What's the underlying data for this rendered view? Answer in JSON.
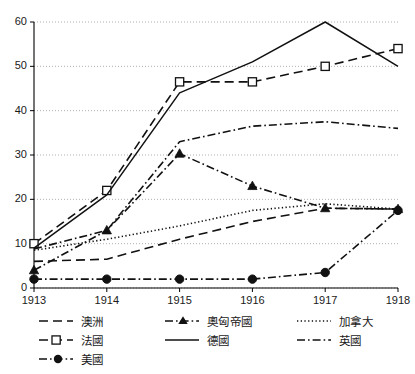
{
  "chart_data": {
    "type": "line",
    "title": "",
    "xlabel": "",
    "ylabel": "",
    "x": [
      1913,
      1914,
      1915,
      1916,
      1917,
      1918
    ],
    "xtick_labels": [
      "1913",
      "1914",
      "1915",
      "1916",
      "1917",
      "1918"
    ],
    "ytick_labels": [
      "0",
      "10",
      "20",
      "30",
      "40",
      "50",
      "60"
    ],
    "ytick_values": [
      0,
      10,
      20,
      30,
      40,
      50,
      60
    ],
    "ylim": [
      0,
      60
    ],
    "xlim": [
      1913,
      1918
    ],
    "grid": "horizontal-dotted",
    "legend_position": "below-plot",
    "legend_columns": 3,
    "series": [
      {
        "name": "澳洲",
        "style": "dashed",
        "marker": "none",
        "color": "#111111",
        "values": [
          6.0,
          6.5,
          11.0,
          15.0,
          18.0,
          17.8
        ]
      },
      {
        "name": "法國",
        "style": "dashed",
        "marker": "open-square",
        "color": "#111111",
        "values": [
          10.0,
          22.0,
          46.5,
          46.5,
          50.0,
          54.0
        ]
      },
      {
        "name": "美國",
        "style": "dash-dot",
        "marker": "filled-circle",
        "color": "#111111",
        "values": [
          2.0,
          2.0,
          2.0,
          2.0,
          3.5,
          17.5
        ]
      },
      {
        "name": "奧匈帝國",
        "style": "dash-dot",
        "marker": "filled-triangle",
        "color": "#111111",
        "values": [
          4.0,
          13.0,
          30.3,
          23.0,
          18.0,
          17.8
        ]
      },
      {
        "name": "德國",
        "style": "solid",
        "marker": "none",
        "color": "#111111",
        "values": [
          9.0,
          21.0,
          44.0,
          51.0,
          60.0,
          50.0
        ]
      },
      {
        "name": "加拿大",
        "style": "dotted",
        "marker": "none",
        "color": "#111111",
        "values": [
          8.5,
          11.0,
          14.0,
          17.5,
          19.0,
          17.8
        ]
      },
      {
        "name": "英國",
        "style": "dash-dot",
        "marker": "none",
        "color": "#111111",
        "values": [
          8.8,
          13.0,
          33.0,
          36.5,
          37.5,
          36.0
        ]
      }
    ]
  },
  "legend": {
    "columns": [
      [
        "澳洲",
        "法國",
        "美國"
      ],
      [
        "奧匈帝國",
        "德國"
      ],
      [
        "加拿大",
        "英國"
      ]
    ]
  }
}
